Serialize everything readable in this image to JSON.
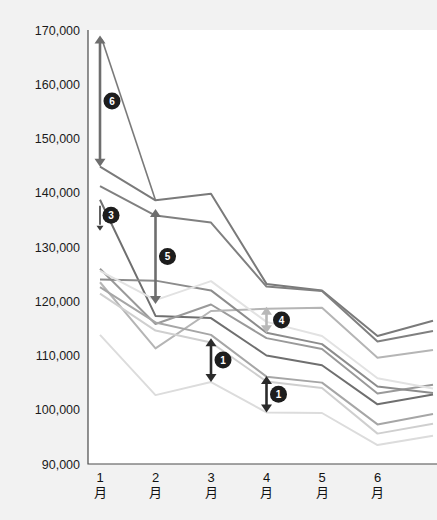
{
  "chart_data": {
    "type": "line",
    "title": "",
    "subtitle": "",
    "xlabel": "",
    "ylabel": "",
    "categories": [
      "1月",
      "2月",
      "3月",
      "4月",
      "5月",
      "6月",
      ""
    ],
    "x_tick_labels": [
      "1月",
      "2月",
      "3月",
      "4月",
      "5月",
      "6月"
    ],
    "y_tick_labels": [
      "170,000",
      "160,000",
      "150,000",
      "140,000",
      "130,000",
      "120,000",
      "110,000",
      "100,000",
      "90,000"
    ],
    "y_tick_values": [
      170000,
      160000,
      150000,
      140000,
      130000,
      120000,
      110000,
      100000,
      90000
    ],
    "ylim": [
      90000,
      170000
    ],
    "grid": false,
    "legend": "none",
    "series": [
      {
        "name": "series-1",
        "color": "#7a7a7a",
        "width": 2.0,
        "values": [
          144800,
          138600,
          139800,
          123200,
          122000,
          113600,
          116400
        ]
      },
      {
        "name": "series-2",
        "color": "#808080",
        "width": 2.0,
        "values": [
          141200,
          135800,
          134500,
          122700,
          121900,
          112600,
          114500
        ]
      },
      {
        "name": "series-3",
        "color": "#6f6f6f",
        "width": 2.0,
        "values": [
          138700,
          117300,
          116900,
          110000,
          108200,
          101000,
          102800
        ]
      },
      {
        "name": "series-4",
        "color": "#9a9a9a",
        "width": 2.0,
        "values": [
          126000,
          115800,
          119400,
          113200,
          111200,
          103000,
          104600
        ]
      },
      {
        "name": "series-5",
        "color": "#b5b5b5",
        "width": 2.0,
        "values": [
          123500,
          111300,
          118200,
          118600,
          118800,
          109600,
          111000
        ]
      },
      {
        "name": "series-6",
        "color": "#8c8c8c",
        "width": 2.0,
        "values": [
          124000,
          123800,
          122000,
          114200,
          112100,
          104300,
          103100
        ]
      },
      {
        "name": "series-7",
        "color": "#a6a6a6",
        "width": 2.0,
        "values": [
          122600,
          116100,
          113800,
          106100,
          105000,
          97300,
          99200
        ]
      },
      {
        "name": "series-8",
        "color": "#cfcfcf",
        "width": 2.0,
        "values": [
          121400,
          114600,
          112400,
          105200,
          104000,
          95600,
          97400
        ]
      },
      {
        "name": "series-9",
        "color": "#dcdcdc",
        "width": 2.0,
        "values": [
          113800,
          102700,
          105100,
          99500,
          99400,
          93500,
          95200
        ]
      },
      {
        "name": "series-10",
        "color": "#e2e2e2",
        "width": 2.0,
        "values": [
          125600,
          120200,
          123700,
          116200,
          113600,
          105800,
          103900
        ]
      }
    ],
    "annotations": [
      {
        "id": "callout-6",
        "label": "6",
        "x_category": "1月",
        "y_low": 144800,
        "y_high": 169000,
        "arrow": "double",
        "color": "#6e6e6e"
      },
      {
        "id": "callout-3",
        "label": "3",
        "x_category": "1月",
        "y_low": 133000,
        "y_high": 138700,
        "arrow": "down",
        "color": "#3a3a3a"
      },
      {
        "id": "callout-5",
        "label": "5",
        "x_category": "2月",
        "y_low": 119500,
        "y_high": 137000,
        "arrow": "double",
        "color": "#6e6e6e"
      },
      {
        "id": "callout-1a",
        "label": "1",
        "x_category": "3月",
        "y_low": 105100,
        "y_high": 113200,
        "arrow": "double",
        "color": "#2b2b2b"
      },
      {
        "id": "callout-1b",
        "label": "1",
        "x_category": "4月",
        "y_low": 99500,
        "y_high": 106200,
        "arrow": "double",
        "color": "#2b2b2b"
      },
      {
        "id": "callout-4",
        "label": "4",
        "x_category": "4月",
        "y_low": 114100,
        "y_high": 119000,
        "arrow": "double",
        "color": "#b8b8b8"
      }
    ]
  },
  "colors": {
    "page_background": "#f2f2f2",
    "plot_background": "#ffffff",
    "axis": "#4a4a4a",
    "tick_text": "#1b1b1b",
    "badge_fill": "#1d1d1d",
    "badge_text": "#ffffff"
  }
}
